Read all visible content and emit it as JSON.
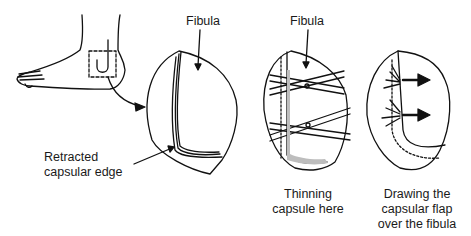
{
  "figure": {
    "panels": [
      {
        "id": "foot",
        "description": "Lateral view of foot with dashed box over lateral ankle incision"
      },
      {
        "id": "panel-1",
        "label_top": "Fibula",
        "label_side": [
          "Retracted",
          "capsular edge"
        ]
      },
      {
        "id": "panel-2",
        "label_top": "Fibula",
        "label_bottom": [
          "Thinning",
          "capsule here"
        ]
      },
      {
        "id": "panel-3",
        "label_bottom": [
          "Drawing the",
          "capsular flap",
          "over the fibula"
        ]
      }
    ]
  },
  "labels": {
    "fibula_1": "Fibula",
    "fibula_2": "Fibula",
    "retracted_line1": "Retracted",
    "retracted_line2": "capsular edge",
    "thinning_line1": "Thinning",
    "thinning_line2": "capsule here",
    "drawing_line1": "Drawing the",
    "drawing_line2": "capsular flap",
    "drawing_line3": "over the fibula"
  },
  "colors": {
    "ink": "#111111",
    "shade": "#bdbdbd",
    "background": "#ffffff"
  }
}
